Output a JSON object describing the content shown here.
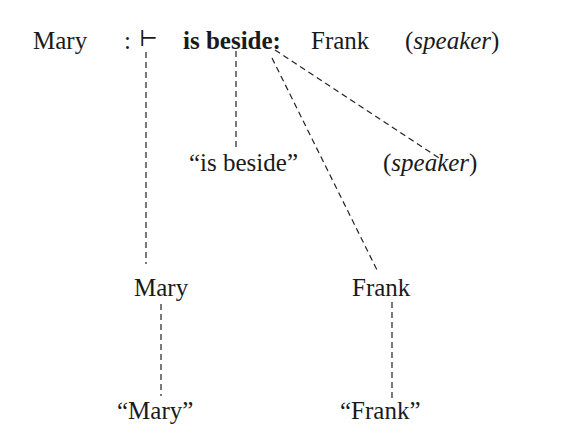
{
  "top_row": {
    "subject": "Mary",
    "colon": ":",
    "turnstile": "⊢",
    "predicate": "is beside:",
    "object": "Frank",
    "speaker_open": "(",
    "speaker": "speaker",
    "speaker_close": ")"
  },
  "middle_row": {
    "predicate_quote": "“is beside”",
    "speaker_open": "(",
    "speaker": "speaker",
    "speaker_close": ")"
  },
  "lower_row": {
    "mary": "Mary",
    "frank": "Frank"
  },
  "bottom_row": {
    "mary_quote": "“Mary”",
    "frank_quote": "“Frank”"
  }
}
